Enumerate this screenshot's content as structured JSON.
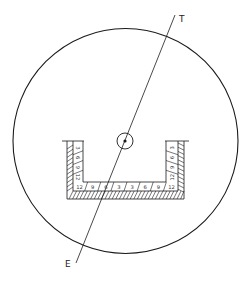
{
  "diagram": {
    "labels": {
      "top": "T",
      "bottom": "E"
    },
    "colors": {
      "stroke": "#1a1a1a",
      "background": "#ffffff",
      "text": "#222222"
    },
    "floor_cells": [
      "12",
      "9",
      "6",
      "3",
      "3",
      "6",
      "9",
      "12"
    ],
    "left_wall_cells": [
      "3",
      "6",
      "9",
      "12"
    ],
    "right_wall_cells": [
      "3",
      "6",
      "9",
      "12"
    ]
  }
}
